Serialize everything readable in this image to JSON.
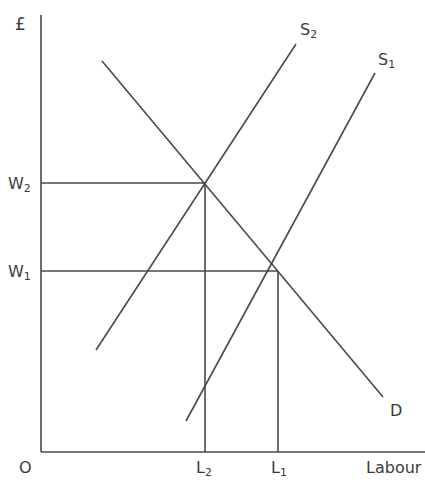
{
  "diagram": {
    "title": "",
    "type": "labour market supply and demand",
    "y_axis_label": "£",
    "x_axis_label": "Labour",
    "origin_label": "O",
    "line_color": "#4a4a4a",
    "curves": [
      {
        "name": "D",
        "label": "D",
        "sub": "",
        "from": [
          102,
          61
        ],
        "to": [
          383,
          397
        ]
      },
      {
        "name": "S2",
        "label": "S",
        "sub": "2",
        "from": [
          96,
          350
        ],
        "to": [
          296,
          44
        ]
      },
      {
        "name": "S1",
        "label": "S",
        "sub": "1",
        "from": [
          186,
          421
        ],
        "to": [
          375,
          73
        ]
      }
    ],
    "equilibria": [
      {
        "wage_label": "W",
        "wage_sub": "2",
        "labour_label": "L",
        "labour_sub": "2",
        "point": [
          205,
          183
        ]
      },
      {
        "wage_label": "W",
        "wage_sub": "1",
        "labour_label": "L",
        "labour_sub": "1",
        "point": [
          278,
          271
        ]
      }
    ]
  }
}
